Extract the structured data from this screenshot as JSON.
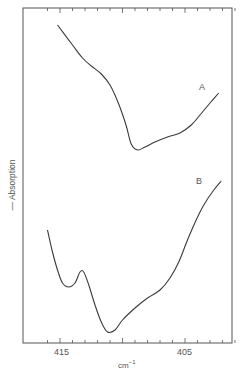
{
  "chart_data": {
    "type": "line",
    "title": "",
    "xlabel": "cm⁻¹",
    "ylabel": "← Absorption",
    "x_direction": "decreasing",
    "xlim": [
      416.5,
      400.2
    ],
    "x_tick_labels": [
      "415",
      "405"
    ],
    "x_tick_values": [
      415,
      405
    ],
    "minor_tick_step": 1,
    "grid": false,
    "legend": "inline labels",
    "y_units": "arbitrary (offset traces)",
    "series": [
      {
        "name": "A",
        "x": [
          415.2,
          414.0,
          413.2,
          412.5,
          411.7,
          411.0,
          410.3,
          409.7,
          409.3,
          408.8,
          408.2,
          407.4,
          406.4,
          405.4,
          404.5,
          403.8,
          403.0,
          402.3
        ],
        "y": [
          25,
          45,
          58,
          66,
          74,
          85,
          104,
          126,
          144,
          150,
          147,
          142,
          137,
          133,
          125,
          115,
          103,
          93
        ]
      },
      {
        "name": "B",
        "x": [
          416.0,
          415.6,
          415.2,
          414.8,
          414.3,
          413.8,
          413.4,
          413.1,
          412.7,
          412.2,
          411.7,
          411.2,
          410.6,
          410.0,
          409.0,
          408.0,
          407.0,
          406.2,
          405.5,
          404.8,
          404.1,
          403.5,
          402.7,
          402.1
        ],
        "y": [
          230,
          252,
          270,
          283,
          287,
          283,
          272,
          272,
          285,
          305,
          322,
          332,
          330,
          320,
          308,
          298,
          290,
          278,
          262,
          240,
          220,
          205,
          190,
          181
        ]
      }
    ],
    "annotations": [
      {
        "text": "A",
        "x": 402.9,
        "y": 87
      },
      {
        "text": "B",
        "x": 403.2,
        "y": 181
      }
    ]
  },
  "labels": {
    "ylabel": "— Absorption",
    "xlabel_base": "cm",
    "xlabel_sup": "−1",
    "tick_415": "415",
    "tick_405": "405",
    "curve_a": "A",
    "curve_b": "B"
  }
}
